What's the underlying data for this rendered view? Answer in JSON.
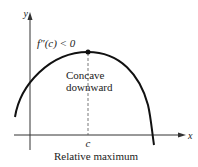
{
  "diagram": {
    "axes": {
      "x_label": "x",
      "y_label": "y"
    },
    "condition": "f″(c) < 0",
    "annotation": [
      "Concave",
      "downward"
    ],
    "point_label": "c",
    "caption": "Relative maximum",
    "colors": {
      "curve": "#111111",
      "axis": "#333333",
      "dashed": "#555555"
    }
  }
}
